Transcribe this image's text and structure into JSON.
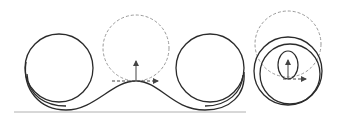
{
  "diagram": {
    "title": "",
    "colors": {
      "track": "#2b2b2b",
      "dashed": "#9a9a9a",
      "ground": "#b0b0b0",
      "arrow": "#444444"
    },
    "elements": [
      {
        "id": "left-loop",
        "type": "loop",
        "center": [
          59,
          68
        ],
        "radius": 34
      },
      {
        "id": "hump",
        "type": "curve",
        "peak": [
          136,
          81
        ]
      },
      {
        "id": "osculating-circle",
        "type": "dashed-circle",
        "center": [
          136,
          48
        ],
        "radius": 33
      },
      {
        "id": "normal-arrow",
        "type": "arrow",
        "from": [
          136,
          81
        ],
        "to": [
          136,
          61
        ]
      },
      {
        "id": "tangent-arrow",
        "type": "dashed-arrow",
        "from": [
          112,
          81
        ],
        "to": [
          158,
          81
        ]
      },
      {
        "id": "right-loop",
        "type": "loop",
        "center": [
          210,
          68
        ],
        "radius": 34
      },
      {
        "id": "ground-line",
        "type": "line",
        "y": 112,
        "x_range": [
          14,
          246
        ]
      },
      {
        "id": "side-dashed-circle",
        "type": "dashed-circle",
        "center": [
          288,
          44
        ],
        "radius": 33
      },
      {
        "id": "side-loop-outer",
        "type": "circle",
        "center": [
          288,
          71
        ],
        "radius": 34
      },
      {
        "id": "side-loop-inner",
        "type": "circle",
        "center": [
          290,
          74
        ],
        "radius": 30
      },
      {
        "id": "side-ellipse",
        "type": "ellipse",
        "center": [
          288,
          65
        ],
        "rx": 10,
        "ry": 14
      },
      {
        "id": "side-normal-arrow",
        "type": "arrow",
        "from": [
          288,
          79
        ],
        "to": [
          288,
          60
        ]
      },
      {
        "id": "side-tangent-arrow",
        "type": "dashed-arrow",
        "from": [
          283,
          79
        ],
        "to": [
          306,
          79
        ]
      }
    ]
  }
}
